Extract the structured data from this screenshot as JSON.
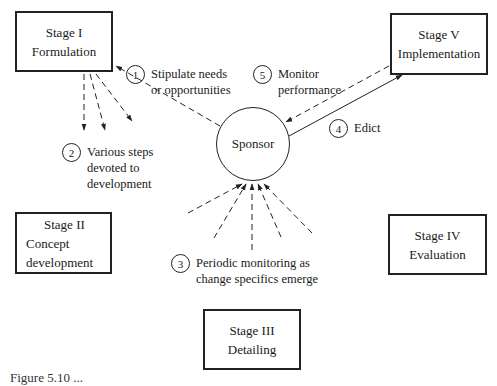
{
  "diagram": {
    "stages": [
      {
        "id": "stage-1",
        "title": "Stage I",
        "name": "Formulation"
      },
      {
        "id": "stage-2",
        "title": "Stage II",
        "name_line1": "Concept",
        "name_line2": "development"
      },
      {
        "id": "stage-3",
        "title": "Stage III",
        "name": "Detailing"
      },
      {
        "id": "stage-4",
        "title": "Stage IV",
        "name": "Evaluation"
      },
      {
        "id": "stage-5",
        "title": "Stage V",
        "name": "Implementation"
      }
    ],
    "center": {
      "label": "Sponsor"
    },
    "annotations": [
      {
        "num": "1",
        "line1": "Stipulate needs",
        "line2": "or opportunities"
      },
      {
        "num": "2",
        "line1": "Various steps",
        "line2": "devoted to",
        "line3": "development"
      },
      {
        "num": "3",
        "line1": "Periodic monitoring as",
        "line2": "change specifics emerge"
      },
      {
        "num": "4",
        "line1": "Edict"
      },
      {
        "num": "5",
        "line1": "Monitor",
        "line2": "performance"
      }
    ],
    "caption": "Figure 5.10 ..."
  },
  "colors": {
    "line": "#222222",
    "background": "#ffffff"
  }
}
